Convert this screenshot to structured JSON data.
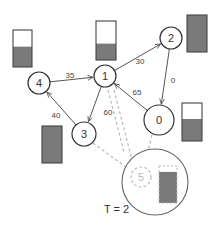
{
  "diagram": {
    "time_label": "T = 2",
    "colors": {
      "stroke": "#333333",
      "edge": "#555555",
      "fill": "#7a7a7a",
      "dashed": "#bbbbbb"
    },
    "nodes": [
      {
        "id": "0",
        "label": "0",
        "cx": 159,
        "cy": 120,
        "r": 15
      },
      {
        "id": "1",
        "label": "1",
        "cx": 105,
        "cy": 76,
        "r": 11
      },
      {
        "id": "2",
        "label": "2",
        "cx": 171,
        "cy": 38,
        "r": 11
      },
      {
        "id": "3",
        "label": "3",
        "cx": 84,
        "cy": 134,
        "r": 12
      },
      {
        "id": "4",
        "label": "4",
        "cx": 39,
        "cy": 83,
        "r": 11
      }
    ],
    "ghost_node": {
      "id": "5",
      "label": "5",
      "cx": 141,
      "cy": 177,
      "r": 10
    },
    "edges": [
      {
        "from": "4",
        "to": "1",
        "label": "35"
      },
      {
        "from": "1",
        "to": "2",
        "label": "30"
      },
      {
        "from": "2",
        "to": "0",
        "label": "0"
      },
      {
        "from": "0",
        "to": "1",
        "label": "65"
      },
      {
        "from": "1",
        "to": "3",
        "label": "60"
      },
      {
        "from": "3",
        "to": "4",
        "label": "40"
      }
    ],
    "buffers": [
      {
        "node": "4",
        "x": 13,
        "y": 30,
        "w": 19,
        "h": 37,
        "fill_fraction": 0.55
      },
      {
        "node": "1",
        "x": 96,
        "y": 21,
        "w": 20,
        "h": 39,
        "fill_fraction": 0.42
      },
      {
        "node": "2",
        "x": 187,
        "y": 15,
        "w": 20,
        "h": 37,
        "fill_fraction": 1.0
      },
      {
        "node": "0",
        "x": 182,
        "y": 103,
        "w": 20,
        "h": 38,
        "fill_fraction": 0.58
      },
      {
        "node": "3",
        "x": 42,
        "y": 126,
        "w": 20,
        "h": 37,
        "fill_fraction": 1.0
      }
    ],
    "ghost_buffer": {
      "node": "5",
      "x": 159,
      "y": 166,
      "w": 18,
      "h": 37,
      "fill_fraction": 0.84
    },
    "zoom_circle": {
      "cx": 155,
      "cy": 182,
      "r": 33
    }
  }
}
